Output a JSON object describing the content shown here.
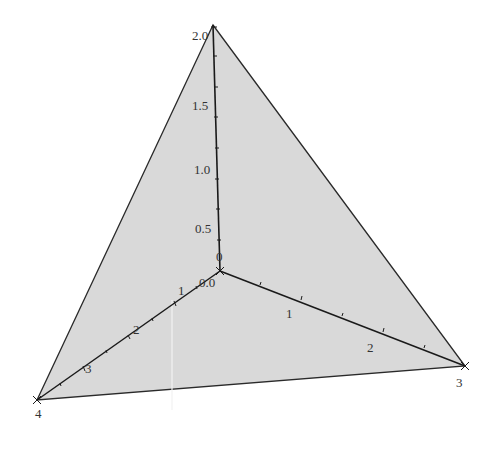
{
  "figure": {
    "colors": {
      "fill": "#d9d9d9",
      "edge": "#2a2a2a",
      "axis": "#1a1a1a",
      "label": "#333333",
      "background": "#ffffff"
    },
    "vertices": {
      "origin": {
        "px": [
          220,
          271
        ],
        "label": "0.0"
      },
      "z_top": {
        "px": [
          213,
          25
        ],
        "label": "2.0"
      },
      "y_left": {
        "px": [
          37,
          400
        ],
        "label": "4"
      },
      "x_right": {
        "px": [
          465,
          366
        ],
        "label": "3"
      }
    },
    "axes": {
      "vertical": {
        "tick_labels": [
          "0",
          "0.5",
          "1.0",
          "1.5",
          "2.0"
        ],
        "max": 2.0
      },
      "left": {
        "tick_labels": [
          "1",
          "2",
          "3",
          "4"
        ],
        "max": 4
      },
      "right": {
        "tick_labels": [
          "1",
          "2",
          "3"
        ],
        "max": 3
      }
    },
    "labels": {
      "z0": "0",
      "z05": "0.5",
      "z10": "1.0",
      "z15": "1.5",
      "z20": "2.0",
      "origin": "0.0",
      "l1": "1",
      "l2": "2",
      "l3": "3",
      "l4": "4",
      "r1": "1",
      "r2": "2",
      "r3": "3"
    }
  }
}
